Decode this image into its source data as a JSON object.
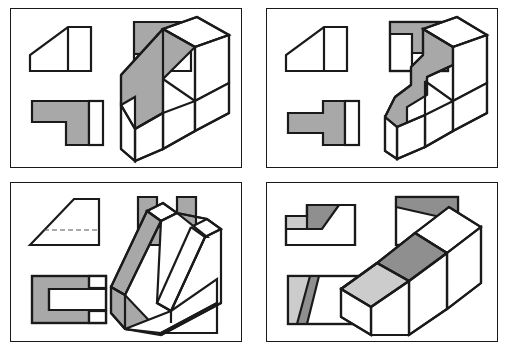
{
  "figure": {
    "type": "engineering-drawing-sheet",
    "panel_count": 4,
    "colors": {
      "outline": "#1a1a1a",
      "paper": "#ffffff",
      "surface_shaded": "#a8a8a8",
      "surface_shaded_dark": "#8f8f8f",
      "surface_shaded_light": "#cccccc",
      "surface_white": "#ffffff",
      "hidden_line": "#555555"
    },
    "stroke": {
      "panel_border": 1,
      "object_line": 2.2,
      "hidden_line": 1
    },
    "panels": [
      {
        "id": "panel-1",
        "name": "L-bracket with inclined face",
        "position": {
          "x": 10,
          "y": 8,
          "w": 232,
          "h": 160
        },
        "views": [
          {
            "id": "p1-front",
            "label": "front-view",
            "kind": "orthographic",
            "shaded": false,
            "polygon": [
              [
                10,
                60
              ],
              [
                10,
                45
              ],
              [
                47,
                10
              ],
              [
                68,
                10
              ],
              [
                68,
                60
              ]
            ],
            "internal_lines": [
              [
                [
                  47,
                  10
                ],
                [
                  47,
                  60
                ]
              ]
            ],
            "hidden_lines": []
          },
          {
            "id": "p1-top",
            "label": "top-view",
            "kind": "orthographic",
            "shaded": true,
            "outline": [
              [
                0,
                0
              ],
              [
                62,
                0
              ],
              [
                62,
                58
              ],
              [
                0,
                58
              ]
            ],
            "faces": [
              {
                "pts": [
                  [
                    0,
                    0
                  ],
                  [
                    62,
                    0
                  ],
                  [
                    62,
                    12
                  ],
                  [
                    28,
                    12
                  ],
                  [
                    28,
                    42
                  ],
                  [
                    0,
                    42
                  ]
                ],
                "fill": "shaded"
              },
              {
                "pts": [
                  [
                    28,
                    12
                  ],
                  [
                    62,
                    12
                  ],
                  [
                    62,
                    58
                  ],
                  [
                    28,
                    58
                  ]
                ],
                "fill": "white"
              },
              {
                "pts": [
                  [
                    0,
                    42
                  ],
                  [
                    28,
                    42
                  ],
                  [
                    28,
                    58
                  ],
                  [
                    0,
                    58
                  ]
                ],
                "fill": "white"
              }
            ]
          },
          {
            "id": "p1-side",
            "label": "side-view",
            "kind": "orthographic",
            "shaded": true,
            "faces": [
              {
                "pts": [
                  [
                    0,
                    0
                  ],
                  [
                    62,
                    0
                  ],
                  [
                    62,
                    52
                  ],
                  [
                    36,
                    52
                  ],
                  [
                    36,
                    22
                  ],
                  [
                    0,
                    22
                  ]
                ],
                "fill": "shaded"
              },
              {
                "pts": [
                  [
                    62,
                    0
                  ],
                  [
                    78,
                    0
                  ],
                  [
                    78,
                    52
                  ],
                  [
                    62,
                    52
                  ]
                ],
                "fill": "white"
              }
            ]
          },
          {
            "id": "p1-isometric",
            "label": "isometric-pictorial",
            "kind": "isometric",
            "shaded": true
          }
        ]
      },
      {
        "id": "panel-2",
        "name": "T-slot block with inclined face",
        "position": {
          "x": 266,
          "y": 8,
          "w": 232,
          "h": 160
        },
        "views": [
          {
            "id": "p2-front",
            "label": "front-view",
            "kind": "orthographic",
            "shaded": false,
            "polygon": [
              [
                10,
                60
              ],
              [
                10,
                45
              ],
              [
                47,
                10
              ],
              [
                68,
                10
              ],
              [
                68,
                60
              ]
            ],
            "internal_lines": [
              [
                [
                  47,
                  10
                ],
                [
                  47,
                  60
                ]
              ]
            ]
          },
          {
            "id": "p2-top",
            "label": "top-view",
            "kind": "orthographic",
            "shaded": true,
            "description": "T shape shaded inside a square outline"
          },
          {
            "id": "p2-side",
            "label": "side-view",
            "kind": "orthographic",
            "shaded": true,
            "description": "T profile, shaded body with white right band"
          },
          {
            "id": "p2-isometric",
            "label": "isometric-pictorial",
            "kind": "isometric",
            "shaded": true
          }
        ]
      },
      {
        "id": "panel-3",
        "name": "Wedge with U channel slot",
        "position": {
          "x": 10,
          "y": 182,
          "w": 232,
          "h": 160
        },
        "views": [
          {
            "id": "p3-front",
            "label": "front-view",
            "kind": "orthographic",
            "shaded": false,
            "polygon": [
              [
                0,
                56
              ],
              [
                44,
                0
              ],
              [
                70,
                0
              ],
              [
                70,
                56
              ]
            ],
            "hidden_lines": [
              [
                [
                  13,
                  40
                ],
                [
                  70,
                  40
                ]
              ]
            ],
            "hidden_line_style": "dashed"
          },
          {
            "id": "p3-top",
            "label": "top-view",
            "kind": "orthographic",
            "shaded": true,
            "description": "U shaped shaded region, square notch open at top"
          },
          {
            "id": "p3-side",
            "label": "side-view",
            "kind": "orthographic",
            "shaded": true,
            "description": "C shaped shaded region with central white slot"
          },
          {
            "id": "p3-isometric",
            "label": "isometric-pictorial",
            "kind": "isometric",
            "shaded": true
          }
        ]
      },
      {
        "id": "panel-4",
        "name": "Stepped block with oblique surface",
        "position": {
          "x": 266,
          "y": 182,
          "w": 232,
          "h": 160
        },
        "views": [
          {
            "id": "p4-front",
            "label": "front-view",
            "kind": "orthographic",
            "shaded": true,
            "description": "Stepped profile with dark shaded inclined face and light step"
          },
          {
            "id": "p4-top",
            "label": "top-view",
            "kind": "orthographic",
            "shaded": true,
            "description": "Rectangle with dark shaded band above a slanted division line"
          },
          {
            "id": "p4-side",
            "label": "side-view",
            "kind": "orthographic",
            "shaded": true,
            "description": "Rectangle with light left zone and dark slanted band"
          },
          {
            "id": "p4-isometric",
            "label": "isometric-pictorial",
            "kind": "isometric",
            "shaded": true
          }
        ]
      }
    ]
  }
}
